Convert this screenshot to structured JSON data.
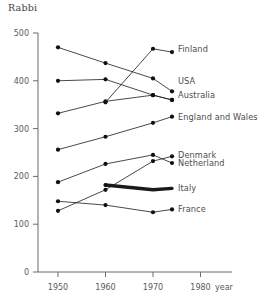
{
  "chart_data": {
    "type": "line",
    "title": "Rabbi",
    "xlabel": "year",
    "ylabel": "",
    "xlim": [
      1945,
      1985
    ],
    "ylim": [
      0,
      500
    ],
    "xticks": [
      1950,
      1960,
      1970,
      1980
    ],
    "yticks": [
      0,
      100,
      200,
      300,
      400,
      500
    ],
    "grid": false,
    "legend_position": "right-inline",
    "series": [
      {
        "name": "Finland",
        "x": [
          1960,
          1970,
          1974
        ],
        "values": [
          355,
          467,
          460
        ],
        "style": "thin",
        "label_y": 467
      },
      {
        "name": "USA",
        "x": [
          1950,
          1960,
          1970,
          1974
        ],
        "values": [
          470,
          437,
          405,
          378
        ],
        "style": "thin",
        "label_y": 400
      },
      {
        "name": "Australia",
        "x": [
          1950,
          1960,
          1970,
          1974
        ],
        "values": [
          400,
          403,
          370,
          360
        ],
        "style": "thin",
        "label_y": 370
      },
      {
        "name": "England and Wales",
        "x": [
          1950,
          1960,
          1970,
          1974
        ],
        "values": [
          332,
          357,
          370,
          360
        ],
        "style": "thin",
        "label_y": 325
      },
      {
        "name": "Denmark",
        "x": [
          1950,
          1960,
          1970,
          1974
        ],
        "values": [
          256,
          283,
          312,
          325
        ],
        "style": "thin",
        "label_y": 245
      },
      {
        "name": "Netherland",
        "x": [
          1950,
          1960,
          1970,
          1974
        ],
        "values": [
          188,
          226,
          245,
          228
        ],
        "style": "thin",
        "label_y": 228
      },
      {
        "name": "Italy",
        "x": [
          1960,
          1970,
          1974
        ],
        "values": [
          182,
          172,
          175
        ],
        "style": "bold",
        "label_y": 175
      },
      {
        "name": "France",
        "x": [
          1950,
          1960,
          1970,
          1974
        ],
        "values": [
          148,
          140,
          125,
          131
        ],
        "style": "thin",
        "label_y": 131
      }
    ],
    "extra_paths": [
      {
        "name": "netherland-rise",
        "x": [
          1950,
          1960,
          1970,
          1974
        ],
        "values": [
          128,
          172,
          232,
          242
        ]
      }
    ]
  },
  "labels": {
    "finland": "Finland",
    "usa": "USA",
    "australia": "Australia",
    "england_wales": "England and Wales",
    "denmark": "Denmark",
    "netherland": "Netherland",
    "italy": "Italy",
    "france": "France"
  },
  "axis": {
    "y_500": "500",
    "y_400": "400",
    "y_300": "300",
    "y_200": "200",
    "y_100": "100",
    "y_0": "0",
    "x_1950": "1950",
    "x_1960": "1960",
    "x_1970": "1970",
    "x_1980": "1980",
    "x_unit": "year"
  }
}
